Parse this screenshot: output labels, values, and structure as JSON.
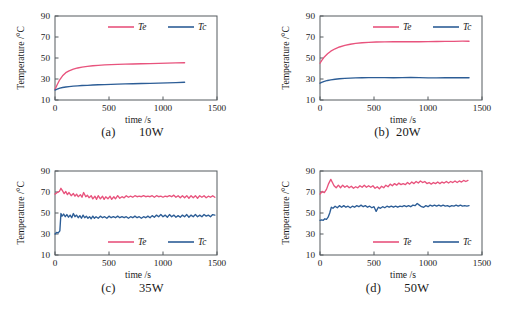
{
  "figure": {
    "panel_count": 4,
    "colors": {
      "Te": "#e8537d",
      "Tc": "#2c5d96",
      "axis": "#555a5e",
      "text": "#1a1a1a"
    }
  },
  "panels": [
    {
      "key": "a",
      "caption": "(a)       10W",
      "legend_position": "top",
      "chart_data": {
        "type": "line",
        "title": "",
        "xlabel": "time  /s",
        "ylabel": "Temperature  /°C",
        "xlim": [
          0,
          1500
        ],
        "ylim": [
          10,
          90
        ],
        "xticks": [
          0,
          500,
          1000,
          1500
        ],
        "yticks": [
          10,
          30,
          50,
          70,
          90
        ],
        "grid": false,
        "legend": [
          "Te",
          "Tc"
        ],
        "series": [
          {
            "name": "Te",
            "color": "#e8537d",
            "x": [
              0,
              20,
              45,
              70,
              100,
              130,
              170,
              210,
              250,
              300,
              350,
              400,
              460,
              520,
              580,
              650,
              720,
              800,
              880,
              960,
              1040,
              1120,
              1200
            ],
            "values": [
              20.0,
              24.5,
              29.5,
              33.0,
              36.0,
              37.8,
              39.4,
              40.5,
              41.3,
              42.0,
              42.6,
              43.0,
              43.4,
              43.7,
              43.9,
              44.1,
              44.3,
              44.5,
              44.7,
              44.9,
              45.1,
              45.3,
              45.5
            ]
          },
          {
            "name": "Tc",
            "color": "#2c5d96",
            "x": [
              0,
              20,
              45,
              70,
              100,
              130,
              170,
              210,
              250,
              300,
              350,
              400,
              460,
              520,
              580,
              650,
              720,
              800,
              880,
              960,
              1040,
              1120,
              1200
            ],
            "values": [
              19.5,
              20.4,
              21.3,
              21.9,
              22.4,
              22.8,
              23.2,
              23.5,
              23.8,
              24.0,
              24.3,
              24.5,
              24.7,
              24.9,
              25.1,
              25.3,
              25.5,
              25.7,
              25.9,
              26.1,
              26.3,
              26.6,
              26.9
            ]
          }
        ]
      }
    },
    {
      "key": "b",
      "caption": "(b)  20W",
      "legend_position": "top",
      "chart_data": {
        "type": "line",
        "title": "",
        "xlabel": "time  /s",
        "ylabel": "Temperature  /°C",
        "xlim": [
          0,
          1500
        ],
        "ylim": [
          10,
          90
        ],
        "xticks": [
          0,
          500,
          1000,
          1500
        ],
        "yticks": [
          10,
          30,
          50,
          70,
          90
        ],
        "grid": false,
        "legend": [
          "Te",
          "Tc"
        ],
        "series": [
          {
            "name": "Te",
            "color": "#e8537d",
            "x": [
              0,
              15,
              40,
              70,
              100,
              140,
              180,
              230,
              280,
              330,
              390,
              450,
              520,
              600,
              680,
              760,
              840,
              920,
              1000,
              1080,
              1160,
              1240,
              1320,
              1380
            ],
            "values": [
              45.0,
              47.5,
              51.0,
              54.0,
              56.5,
              58.8,
              60.5,
              62.0,
              63.1,
              63.9,
              64.5,
              64.9,
              65.2,
              65.4,
              65.5,
              65.5,
              65.6,
              65.5,
              65.6,
              65.7,
              65.8,
              65.9,
              66.0,
              66.0
            ]
          },
          {
            "name": "Tc",
            "color": "#2c5d96",
            "x": [
              0,
              15,
              40,
              70,
              100,
              140,
              180,
              230,
              280,
              330,
              390,
              450,
              520,
              600,
              680,
              760,
              840,
              920,
              1000,
              1080,
              1160,
              1240,
              1320,
              1380
            ],
            "values": [
              26.0,
              26.8,
              27.8,
              28.6,
              29.2,
              29.8,
              30.2,
              30.6,
              30.9,
              31.1,
              31.2,
              31.3,
              31.3,
              31.3,
              31.2,
              31.3,
              31.4,
              31.3,
              31.0,
              31.1,
              31.2,
              31.2,
              31.2,
              31.2
            ]
          }
        ]
      }
    },
    {
      "key": "c",
      "caption": "(c)       35W",
      "legend_position": "bottom",
      "chart_data": {
        "type": "line",
        "title": "",
        "xlabel": "time  /s",
        "ylabel": "Temperature  /°C",
        "xlim": [
          0,
          1500
        ],
        "ylim": [
          10,
          90
        ],
        "xticks": [
          0,
          500,
          1000,
          1500
        ],
        "yticks": [
          10,
          30,
          50,
          70,
          90
        ],
        "grid": false,
        "legend": [
          "Te",
          "Tc"
        ],
        "series": [
          {
            "name": "Te",
            "color": "#e8537d",
            "x": [
              0,
              20,
              40,
              55,
              70,
              85,
              100,
              115,
              130,
              150,
              170,
              185,
              200,
              215,
              235,
              250,
              265,
              285,
              300,
              315,
              335,
              350,
              370,
              385,
              400,
              420,
              440,
              455,
              470,
              490,
              510,
              525,
              545,
              560,
              580,
              600,
              620,
              640,
              660,
              680,
              700,
              720,
              740,
              760,
              780,
              800,
              820,
              840,
              860,
              880,
              900,
              920,
              940,
              960,
              980,
              1000,
              1020,
              1040,
              1060,
              1080,
              1100,
              1120,
              1140,
              1160,
              1180,
              1200,
              1220,
              1240,
              1260,
              1280,
              1300,
              1320,
              1340,
              1360,
              1380,
              1400,
              1420,
              1440,
              1460,
              1480
            ],
            "values": [
              68.0,
              69.5,
              70.5,
              73.5,
              71.0,
              68.5,
              70.5,
              67.5,
              69.5,
              66.5,
              68.5,
              66.0,
              68.0,
              65.5,
              67.5,
              65.0,
              69.5,
              65.5,
              67.0,
              64.5,
              66.5,
              63.5,
              66.0,
              63.0,
              66.5,
              63.5,
              66.0,
              63.0,
              65.5,
              63.5,
              66.0,
              63.0,
              65.5,
              63.5,
              66.5,
              64.0,
              65.5,
              64.5,
              66.5,
              65.0,
              66.0,
              65.0,
              66.5,
              65.5,
              66.0,
              65.5,
              66.5,
              65.5,
              66.0,
              65.5,
              66.5,
              65.0,
              66.5,
              65.5,
              66.0,
              65.0,
              66.0,
              65.5,
              66.5,
              65.5,
              67.0,
              65.0,
              66.5,
              64.5,
              66.5,
              64.5,
              66.5,
              64.0,
              66.5,
              64.5,
              66.5,
              64.0,
              66.5,
              65.0,
              66.5,
              64.5,
              66.0,
              65.0,
              66.5,
              65.0,
              66.0
            ]
          },
          {
            "name": "Tc",
            "color": "#2c5d96",
            "x": [
              0,
              15,
              30,
              45,
              55,
              65,
              80,
              95,
              110,
              125,
              140,
              155,
              170,
              185,
              200,
              215,
              230,
              245,
              260,
              275,
              290,
              305,
              320,
              335,
              350,
              365,
              380,
              400,
              420,
              440,
              460,
              480,
              500,
              520,
              540,
              560,
              580,
              600,
              620,
              640,
              660,
              680,
              700,
              720,
              740,
              760,
              780,
              800,
              820,
              840,
              860,
              880,
              900,
              920,
              940,
              960,
              980,
              1000,
              1020,
              1040,
              1060,
              1080,
              1100,
              1120,
              1140,
              1160,
              1180,
              1200,
              1220,
              1240,
              1260,
              1280,
              1300,
              1320,
              1340,
              1360,
              1380,
              1400,
              1420,
              1440,
              1460,
              1480
            ],
            "values": [
              30.0,
              31.5,
              31.0,
              33.0,
              49.5,
              47.0,
              49.0,
              46.5,
              48.5,
              46.0,
              48.0,
              45.5,
              49.5,
              46.5,
              48.0,
              45.5,
              47.5,
              45.0,
              48.0,
              45.5,
              47.0,
              45.0,
              46.5,
              44.5,
              47.0,
              45.0,
              46.5,
              45.0,
              47.0,
              45.5,
              46.5,
              45.0,
              47.0,
              45.5,
              46.5,
              45.5,
              47.0,
              45.5,
              46.5,
              45.5,
              46.5,
              45.0,
              46.5,
              45.5,
              47.0,
              45.5,
              46.5,
              45.0,
              46.5,
              45.5,
              47.0,
              45.5,
              47.5,
              46.0,
              48.0,
              46.5,
              48.5,
              46.5,
              48.0,
              46.0,
              48.5,
              46.5,
              48.0,
              46.0,
              47.5,
              46.0,
              48.0,
              46.5,
              48.5,
              46.0,
              48.0,
              46.5,
              48.5,
              46.5,
              48.0,
              46.5,
              48.5,
              47.0,
              48.0,
              46.5,
              48.5,
              48.0
            ]
          }
        ]
      }
    },
    {
      "key": "d",
      "caption": "(d)       50W",
      "legend_position": "bottom",
      "chart_data": {
        "type": "line",
        "title": "",
        "xlabel": "time  /s",
        "ylabel": "Temperature  /°C",
        "xlim": [
          0,
          1500
        ],
        "ylim": [
          10,
          90
        ],
        "xticks": [
          0,
          500,
          1000,
          1500
        ],
        "yticks": [
          10,
          30,
          50,
          70,
          90
        ],
        "grid": false,
        "legend": [
          "Te",
          "Tc"
        ],
        "series": [
          {
            "name": "Te",
            "color": "#e8537d",
            "x": [
              0,
              20,
              40,
              60,
              80,
              100,
              115,
              130,
              150,
              170,
              190,
              210,
              230,
              250,
              270,
              290,
              310,
              330,
              350,
              370,
              390,
              410,
              430,
              450,
              470,
              490,
              510,
              530,
              550,
              570,
              590,
              610,
              630,
              650,
              670,
              690,
              710,
              730,
              750,
              770,
              790,
              810,
              830,
              850,
              870,
              890,
              910,
              930,
              950,
              970,
              990,
              1010,
              1030,
              1050,
              1070,
              1090,
              1110,
              1130,
              1150,
              1170,
              1190,
              1210,
              1230,
              1250,
              1270,
              1290,
              1310,
              1330,
              1350,
              1370
            ],
            "values": [
              68.0,
              70.5,
              69.5,
              72.5,
              78.0,
              82.0,
              79.0,
              76.0,
              74.0,
              76.5,
              74.0,
              76.5,
              74.5,
              76.0,
              74.0,
              75.5,
              73.5,
              75.0,
              74.0,
              76.0,
              74.5,
              76.5,
              74.5,
              76.0,
              74.5,
              76.0,
              73.5,
              75.0,
              73.0,
              75.5,
              74.0,
              76.5,
              75.0,
              77.5,
              76.0,
              78.0,
              76.5,
              78.5,
              77.0,
              78.0,
              77.0,
              79.0,
              77.5,
              79.5,
              78.0,
              80.0,
              78.5,
              80.5,
              79.0,
              80.0,
              78.0,
              79.0,
              77.5,
              79.0,
              78.0,
              79.5,
              78.0,
              79.5,
              78.5,
              80.0,
              78.5,
              80.0,
              79.0,
              80.5,
              79.0,
              80.5,
              79.5,
              81.0,
              80.0,
              81.0
            ]
          },
          {
            "name": "Tc",
            "color": "#2c5d96",
            "x": [
              0,
              15,
              30,
              45,
              60,
              75,
              90,
              105,
              120,
              140,
              160,
              180,
              200,
              220,
              240,
              260,
              280,
              300,
              320,
              340,
              360,
              380,
              400,
              420,
              440,
              460,
              480,
              500,
              520,
              540,
              560,
              580,
              600,
              620,
              640,
              660,
              680,
              700,
              720,
              740,
              760,
              780,
              800,
              820,
              840,
              860,
              880,
              900,
              920,
              940,
              960,
              980,
              1000,
              1020,
              1040,
              1060,
              1080,
              1100,
              1120,
              1140,
              1160,
              1180,
              1200,
              1220,
              1240,
              1260,
              1280,
              1300,
              1320,
              1340,
              1360,
              1380
            ],
            "values": [
              43.0,
              43.5,
              43.0,
              44.5,
              44.0,
              46.0,
              50.0,
              55.5,
              54.5,
              56.5,
              55.0,
              57.0,
              55.5,
              57.0,
              55.5,
              56.5,
              55.0,
              56.5,
              55.5,
              57.0,
              56.0,
              57.5,
              56.0,
              57.0,
              55.5,
              56.5,
              55.0,
              56.0,
              51.5,
              55.5,
              54.5,
              56.0,
              55.0,
              56.5,
              55.5,
              56.5,
              55.5,
              56.5,
              55.5,
              56.5,
              56.0,
              57.0,
              56.0,
              57.0,
              56.0,
              57.5,
              57.0,
              59.0,
              57.5,
              56.0,
              55.5,
              57.0,
              56.0,
              57.5,
              56.5,
              57.5,
              56.5,
              57.5,
              56.5,
              57.5,
              56.5,
              57.0,
              56.0,
              57.0,
              56.5,
              57.5,
              56.5,
              57.5,
              56.5,
              57.0,
              56.5,
              57.0
            ]
          }
        ]
      }
    }
  ]
}
